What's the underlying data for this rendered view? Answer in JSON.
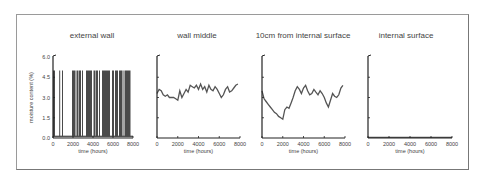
{
  "chart_data": [
    {
      "type": "bar",
      "title": "external wall",
      "xlabel": "time (hours)",
      "ylabel": "moisture content (%)",
      "xlim": [
        0,
        8000
      ],
      "ylim": [
        0,
        6.0
      ],
      "xticks": [
        "0",
        "2000",
        "4000",
        "6000",
        "8000"
      ],
      "yticks": [
        "0.0",
        "1.5",
        "3.0",
        "4.5",
        "6.0"
      ],
      "grid": false,
      "description": "moisture content alternating between approx 0.1% and 5.0% (saturated) in blocks over the year",
      "segments_high": [
        [
          0,
          200
        ],
        [
          620,
          700
        ],
        [
          900,
          1000
        ],
        [
          1900,
          2250
        ],
        [
          2350,
          2550
        ],
        [
          2600,
          2800
        ],
        [
          2900,
          3000
        ],
        [
          3300,
          3900
        ],
        [
          4050,
          4250
        ],
        [
          4300,
          4500
        ],
        [
          4600,
          4700
        ],
        [
          4900,
          5700
        ],
        [
          5900,
          6100
        ],
        [
          6200,
          6500
        ],
        [
          6600,
          6950
        ],
        [
          7050,
          7150
        ],
        [
          7200,
          7750
        ]
      ],
      "high_value": 5.0,
      "low_value": 0.1
    },
    {
      "type": "line",
      "title": "wall middle",
      "xlabel": "time (hours)",
      "xlim": [
        0,
        8000
      ],
      "ylim": [
        0,
        6.0
      ],
      "xticks": [
        "0",
        "2000",
        "4000",
        "6000",
        "8000"
      ],
      "grid": false,
      "x": [
        0,
        200,
        400,
        600,
        800,
        1000,
        1200,
        1400,
        1600,
        1800,
        2000,
        2200,
        2400,
        2600,
        2800,
        3000,
        3200,
        3400,
        3600,
        3800,
        4000,
        4200,
        4400,
        4600,
        4800,
        5000,
        5200,
        5400,
        5600,
        5800,
        6000,
        6200,
        6400,
        6600,
        6800,
        7000,
        7200,
        7400,
        7600,
        7800
      ],
      "values": [
        3.3,
        3.6,
        3.5,
        3.2,
        3.1,
        3.2,
        3.0,
        3.0,
        3.0,
        2.9,
        2.8,
        3.5,
        3.0,
        3.3,
        3.6,
        3.4,
        3.9,
        3.8,
        3.7,
        3.9,
        3.6,
        4.0,
        3.6,
        3.8,
        3.4,
        3.9,
        3.6,
        3.5,
        3.8,
        3.6,
        3.3,
        3.0,
        3.2,
        3.6,
        3.8,
        3.4,
        3.5,
        3.7,
        3.9,
        4.0
      ]
    },
    {
      "type": "line",
      "title": "10cm from internal surface",
      "xlabel": "time (hours)",
      "xlim": [
        0,
        8000
      ],
      "ylim": [
        0,
        6.0
      ],
      "xticks": [
        "0",
        "2000",
        "4000",
        "6000",
        "8000"
      ],
      "grid": false,
      "x": [
        0,
        200,
        400,
        600,
        800,
        1000,
        1200,
        1400,
        1600,
        1800,
        2000,
        2200,
        2400,
        2600,
        2800,
        3000,
        3200,
        3400,
        3600,
        3800,
        4000,
        4200,
        4400,
        4600,
        4800,
        5000,
        5200,
        5400,
        5600,
        5800,
        6000,
        6200,
        6400,
        6600,
        6800,
        7000,
        7200,
        7400,
        7600,
        7800
      ],
      "values": [
        3.5,
        2.9,
        2.7,
        2.5,
        2.3,
        2.1,
        1.9,
        1.8,
        1.6,
        1.5,
        1.4,
        2.1,
        2.3,
        2.2,
        2.6,
        3.0,
        3.5,
        3.8,
        3.6,
        3.3,
        3.7,
        3.9,
        3.5,
        3.2,
        3.3,
        3.6,
        3.4,
        3.2,
        3.5,
        3.3,
        3.0,
        2.6,
        2.3,
        2.8,
        3.3,
        3.1,
        3.0,
        3.2,
        3.7,
        3.9
      ]
    },
    {
      "type": "line",
      "title": "internal surface",
      "xlabel": "time (hours)",
      "xlim": [
        0,
        8000
      ],
      "ylim": [
        0,
        6.0
      ],
      "xticks": [
        "0",
        "2000",
        "4000",
        "6000",
        "8000"
      ],
      "grid": false,
      "x": [
        0,
        8000
      ],
      "values": [
        0.05,
        0.05
      ]
    }
  ],
  "titles": [
    "external wall",
    "wall middle",
    "10cm from internal surface",
    "internal surface"
  ]
}
